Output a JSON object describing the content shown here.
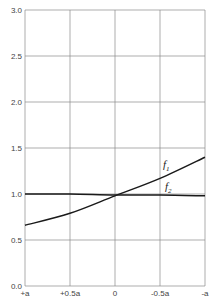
{
  "chart_data": {
    "type": "line",
    "title": "",
    "xlabel": "",
    "ylabel": "",
    "x_tick_labels": [
      "+a",
      "+0.5a",
      "0",
      "-0.5a",
      "-a"
    ],
    "x": [
      1.0,
      0.5,
      0.0,
      -0.5,
      -1.0
    ],
    "y_tick_labels": [
      "0.0",
      "0.5",
      "1.0",
      "1.5",
      "2.0",
      "2.5",
      "3.0"
    ],
    "ylim": [
      0.0,
      3.0
    ],
    "grid": true,
    "legend": "inline labels",
    "series": [
      {
        "name": "f1",
        "label_main": "f",
        "label_sub": "1",
        "values": [
          0.66,
          0.79,
          0.98,
          1.17,
          1.4
        ]
      },
      {
        "name": "f2",
        "label_main": "f",
        "label_sub": "2",
        "values": [
          1.0,
          1.0,
          0.99,
          0.99,
          0.98
        ]
      }
    ]
  },
  "colors": {
    "grid": "#8a8a8a",
    "curve": "#1a1a1a",
    "text": "#444444"
  }
}
